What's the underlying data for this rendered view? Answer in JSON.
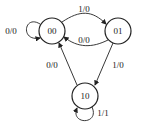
{
  "diagram": {
    "type": "state-machine",
    "states": [
      {
        "id": "s00",
        "label": "00"
      },
      {
        "id": "s01",
        "label": "01"
      },
      {
        "id": "s10",
        "label": "10"
      }
    ],
    "transitions": [
      {
        "from": "00",
        "to": "00",
        "label": "0/0"
      },
      {
        "from": "00",
        "to": "01",
        "label": "1/0"
      },
      {
        "from": "01",
        "to": "00",
        "label": "0/0"
      },
      {
        "from": "01",
        "to": "10",
        "label": "1/0"
      },
      {
        "from": "10",
        "to": "00",
        "label": "0/0"
      },
      {
        "from": "10",
        "to": "10",
        "label": "1/1"
      }
    ]
  }
}
